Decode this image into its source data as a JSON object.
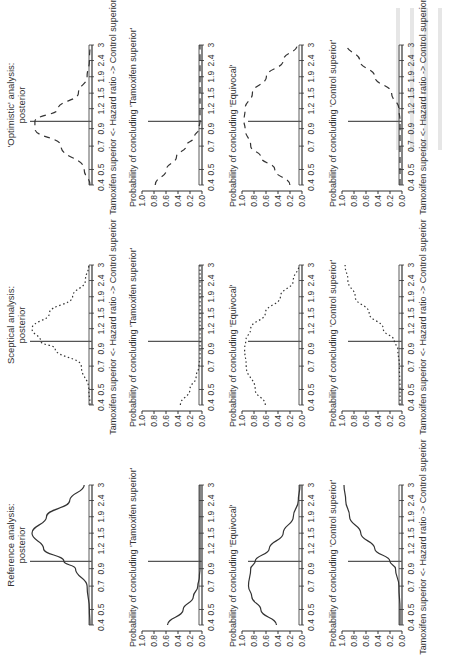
{
  "figure": {
    "columns": [
      {
        "key": "reference",
        "title_line1": "Reference analysis:",
        "title_line2": "posterior",
        "dash": "solid"
      },
      {
        "key": "sceptical",
        "title_line1": "Sceptical analysis:",
        "title_line2": "posterior",
        "dash": "dotted"
      },
      {
        "key": "optimistic",
        "title_line1": "'Optimistic' analysis:",
        "title_line2": "posterior",
        "dash": "dashed"
      }
    ],
    "row_titles": [
      "",
      "Probability of concluding 'Tamoxifen superior'",
      "Probability of concluding 'Equivocal'",
      "Probability of concluding 'Control superior'"
    ],
    "x_ticks": [
      "0.4",
      "0.5",
      "0.7",
      "0.9",
      "1.2",
      "1.5",
      "1.9",
      "2.4",
      "3"
    ],
    "y_ticks": [
      "1.0",
      "0.8",
      "0.6",
      "0.4",
      "0.2",
      "0.0"
    ],
    "xlabel": "Tamoxifen superior <- Hazard ratio -> Control superior",
    "reference_line_hr": 1.0
  },
  "chart_data": [
    {
      "type": "line",
      "title": "Reference analysis: posterior",
      "xlabel": "Hazard ratio (log scale)",
      "ylabel": "",
      "x": [
        0.4,
        0.5,
        0.7,
        0.9,
        1.0,
        1.2,
        1.5,
        1.9,
        2.4,
        3
      ],
      "values": [
        0.0,
        0.01,
        0.05,
        0.25,
        0.45,
        0.8,
        1.0,
        0.75,
        0.35,
        0.1
      ],
      "scale": "relative density"
    },
    {
      "type": "line",
      "title": "Reference: Probability of concluding 'Tamoxifen superior'",
      "x": [
        0.4,
        0.5,
        0.6,
        0.7,
        0.8,
        0.9,
        1.2,
        1.5,
        1.9,
        2.4,
        3
      ],
      "values": [
        0.58,
        0.3,
        0.12,
        0.04,
        0.01,
        0.0,
        0.0,
        0.0,
        0.0,
        0.0,
        0.0
      ],
      "ylim": [
        0,
        1
      ]
    },
    {
      "type": "line",
      "title": "Reference: Probability of concluding 'Equivocal'",
      "x": [
        0.4,
        0.5,
        0.6,
        0.7,
        0.9,
        1.0,
        1.2,
        1.5,
        1.9,
        2.4,
        3
      ],
      "values": [
        0.42,
        0.7,
        0.86,
        0.92,
        0.88,
        0.8,
        0.55,
        0.3,
        0.12,
        0.03,
        0.0
      ],
      "ylim": [
        0,
        1
      ]
    },
    {
      "type": "line",
      "title": "Reference: Probability of concluding 'Control superior'",
      "x": [
        0.4,
        0.5,
        0.7,
        0.9,
        1.0,
        1.2,
        1.5,
        1.9,
        2.4,
        3
      ],
      "values": [
        0.0,
        0.0,
        0.02,
        0.08,
        0.18,
        0.45,
        0.7,
        0.9,
        0.97,
        1.0
      ],
      "ylim": [
        0,
        1
      ]
    },
    {
      "type": "line",
      "title": "Sceptical analysis: posterior",
      "x": [
        0.4,
        0.5,
        0.7,
        0.9,
        1.0,
        1.2,
        1.5,
        1.9,
        2.4,
        3
      ],
      "values": [
        0.0,
        0.02,
        0.15,
        0.6,
        0.85,
        1.0,
        0.7,
        0.3,
        0.08,
        0.02
      ],
      "scale": "relative density"
    },
    {
      "type": "line",
      "title": "Sceptical: Probability of concluding 'Tamoxifen superior'",
      "x": [
        0.4,
        0.5,
        0.6,
        0.7,
        0.8,
        0.9,
        1.2,
        3
      ],
      "values": [
        0.35,
        0.18,
        0.07,
        0.02,
        0.0,
        0.0,
        0.0,
        0.0
      ],
      "ylim": [
        0,
        1
      ]
    },
    {
      "type": "line",
      "title": "Sceptical: Probability of concluding 'Equivocal'",
      "x": [
        0.4,
        0.5,
        0.7,
        0.9,
        1.0,
        1.2,
        1.5,
        1.9,
        2.4,
        3
      ],
      "values": [
        0.62,
        0.8,
        0.96,
        0.99,
        0.97,
        0.88,
        0.62,
        0.35,
        0.12,
        0.02
      ],
      "ylim": [
        0,
        1
      ]
    },
    {
      "type": "line",
      "title": "Sceptical: Probability of concluding 'Control superior'",
      "x": [
        0.4,
        0.5,
        0.7,
        0.9,
        1.0,
        1.2,
        1.5,
        1.9,
        2.4,
        3
      ],
      "values": [
        0.0,
        0.0,
        0.01,
        0.04,
        0.1,
        0.3,
        0.55,
        0.8,
        0.93,
        0.98
      ],
      "ylim": [
        0,
        1
      ]
    },
    {
      "type": "line",
      "title": "'Optimistic' analysis: posterior",
      "x": [
        0.4,
        0.5,
        0.7,
        0.9,
        1.0,
        1.2,
        1.5,
        1.9,
        2.4,
        3
      ],
      "values": [
        0.0,
        0.1,
        0.5,
        0.95,
        0.95,
        0.55,
        0.2,
        0.05,
        0.01,
        0.0
      ],
      "scale": "relative density"
    },
    {
      "type": "line",
      "title": "Optimistic: Probability of concluding 'Tamoxifen superior'",
      "x": [
        0.4,
        0.5,
        0.6,
        0.7,
        0.8,
        0.9,
        1.0,
        1.2,
        3
      ],
      "values": [
        0.8,
        0.6,
        0.42,
        0.25,
        0.1,
        0.02,
        0.0,
        0.0,
        0.0
      ],
      "ylim": [
        0,
        1
      ]
    },
    {
      "type": "line",
      "title": "Optimistic: Probability of concluding 'Equivocal'",
      "x": [
        0.4,
        0.5,
        0.6,
        0.7,
        0.9,
        1.0,
        1.2,
        1.5,
        1.9,
        2.4,
        3
      ],
      "values": [
        0.18,
        0.45,
        0.7,
        0.88,
        0.98,
        1.0,
        0.98,
        0.85,
        0.6,
        0.3,
        0.05
      ],
      "ylim": [
        0,
        1
      ]
    },
    {
      "type": "line",
      "title": "Optimistic: Probability of concluding 'Control superior'",
      "x": [
        0.4,
        0.5,
        0.7,
        0.9,
        1.0,
        1.2,
        1.5,
        1.9,
        2.4,
        3
      ],
      "values": [
        0.0,
        0.0,
        0.0,
        0.0,
        0.0,
        0.02,
        0.15,
        0.45,
        0.72,
        0.95
      ],
      "ylim": [
        0,
        1
      ]
    }
  ]
}
